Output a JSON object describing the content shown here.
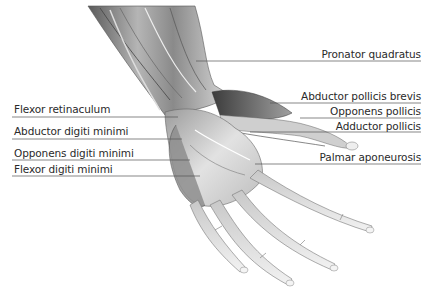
{
  "figure": {
    "labels_left": [
      {
        "text": "Flexor retinaculum",
        "x": 14,
        "y": 103,
        "line": [
          12,
          117,
          178,
          117
        ]
      },
      {
        "text": "Abductor digiti minimi",
        "x": 14,
        "y": 125,
        "line": [
          12,
          139,
          182,
          139
        ]
      },
      {
        "text": "Opponens digiti minimi",
        "x": 14,
        "y": 147,
        "line": [
          12,
          160,
          190,
          160
        ]
      },
      {
        "text": "Flexor digiti minimi",
        "x": 14,
        "y": 163,
        "line": [
          12,
          176,
          200,
          176
        ]
      }
    ],
    "labels_right": [
      {
        "text": "Pronator quadratus",
        "right": 12,
        "y": 48,
        "line": [
          196,
          61,
          421,
          61
        ]
      },
      {
        "text": "Abductor pollicis brevis",
        "right": 12,
        "y": 91,
        "line": [
          270,
          103,
          421,
          103
        ]
      },
      {
        "text": "Opponens pollicis",
        "right": 12,
        "y": 106,
        "line": [
          300,
          118,
          421,
          118
        ]
      },
      {
        "text": "Adductor pollicis",
        "right": 12,
        "y": 121,
        "line": [
          250,
          132,
          421,
          132
        ]
      },
      {
        "text": "Palmar aponeurosis",
        "right": 12,
        "y": 151,
        "line": [
          255,
          164,
          421,
          164
        ]
      }
    ]
  },
  "colors": {
    "background": "#ffffff",
    "label_text": "#2a2a2a",
    "leader_line": "#555555",
    "muscle_dark": "#4a4a4a",
    "muscle_mid": "#9a9a9a",
    "muscle_light": "#e6e6e6"
  }
}
